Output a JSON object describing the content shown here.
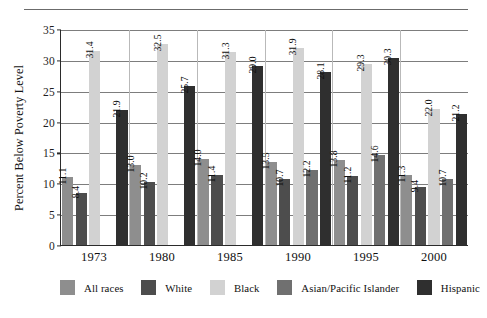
{
  "chart_data": {
    "type": "bar",
    "title": "",
    "xlabel": "",
    "ylabel": "Percent Below Poverty Level",
    "ylim": [
      0,
      35
    ],
    "yticks": [
      0,
      5,
      10,
      15,
      20,
      25,
      30,
      35
    ],
    "ytick_labels": [
      "0",
      "5",
      "10",
      "15",
      "20",
      "25",
      "30",
      "35"
    ],
    "grid": true,
    "legend_position": "bottom",
    "categories": [
      "1973",
      "1980",
      "1985",
      "1990",
      "1995",
      "2000"
    ],
    "series": [
      {
        "name": "All races",
        "color": "#8e8e8e",
        "values": [
          11.1,
          13.0,
          14.0,
          13.5,
          13.8,
          11.3
        ]
      },
      {
        "name": "White",
        "color": "#4d4d4d",
        "values": [
          8.4,
          10.2,
          11.4,
          10.7,
          11.2,
          9.4
        ]
      },
      {
        "name": "Black",
        "color": "#d2d2d2",
        "values": [
          31.4,
          32.5,
          31.3,
          31.9,
          29.3,
          22.0
        ]
      },
      {
        "name": "Asian/Pacific Islander",
        "color": "#707070",
        "values": [
          null,
          null,
          null,
          12.2,
          14.6,
          10.7
        ]
      },
      {
        "name": "Hispanic",
        "color": "#2f2f2f",
        "values": [
          21.9,
          25.7,
          29.0,
          28.1,
          30.3,
          21.2
        ]
      }
    ],
    "value_labels": {
      "1973": [
        "11.1",
        "8.4",
        "31.4",
        "",
        "21.9"
      ],
      "1980": [
        "13.0",
        "10.2",
        "32.5",
        "",
        "25.7"
      ],
      "1985": [
        "14.0",
        "11.4",
        "31.3",
        "",
        "29.0"
      ],
      "1990": [
        "13.5",
        "10.7",
        "31.9",
        "12.2",
        "28.1"
      ],
      "1995": [
        "13.8",
        "11.2",
        "29.3",
        "14.6",
        "30.3"
      ],
      "2000": [
        "11.3",
        "9.4",
        "22.0",
        "10.7",
        "21.2"
      ]
    }
  },
  "axis": {
    "y_title": "Percent Below Poverty Level",
    "y_ticks": [
      "35",
      "30",
      "25",
      "20",
      "15",
      "10",
      "5",
      "0"
    ],
    "x_ticks": [
      "1973",
      "1980",
      "1985",
      "1990",
      "1995",
      "2000"
    ]
  },
  "legend": {
    "items": [
      {
        "label": "All races",
        "color": "#8e8e8e"
      },
      {
        "label": "White",
        "color": "#4d4d4d"
      },
      {
        "label": "Black",
        "color": "#d2d2d2"
      },
      {
        "label": "Asian/Pacific Islander",
        "color": "#707070"
      },
      {
        "label": "Hispanic",
        "color": "#2f2f2f"
      }
    ]
  }
}
